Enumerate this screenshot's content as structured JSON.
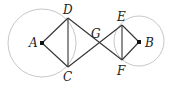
{
  "diagram": {
    "circles": [
      {
        "name": "A",
        "cx": 42,
        "cy": 43,
        "r": 34,
        "stroke": "#c8c8c8"
      },
      {
        "name": "B",
        "cx": 139,
        "cy": 41,
        "r": 25,
        "stroke": "#c8c8c8"
      }
    ],
    "points": {
      "A": {
        "x": 42,
        "y": 43,
        "label": "A",
        "lx": 29,
        "ly": 47
      },
      "B": {
        "x": 139,
        "y": 42,
        "label": "B",
        "lx": 145,
        "ly": 47
      },
      "C": {
        "x": 68,
        "y": 67,
        "label": "C",
        "lx": 63,
        "ly": 81
      },
      "D": {
        "x": 68,
        "y": 18,
        "label": "D",
        "lx": 63,
        "ly": 14
      },
      "E": {
        "x": 122,
        "y": 25,
        "label": "E",
        "lx": 117,
        "ly": 21
      },
      "F": {
        "x": 122,
        "y": 60,
        "label": "F",
        "lx": 117,
        "ly": 75
      },
      "G": {
        "x": 95,
        "y": 42,
        "label": "G",
        "lx": 92,
        "ly": 38
      }
    },
    "line_color": "#333333"
  }
}
